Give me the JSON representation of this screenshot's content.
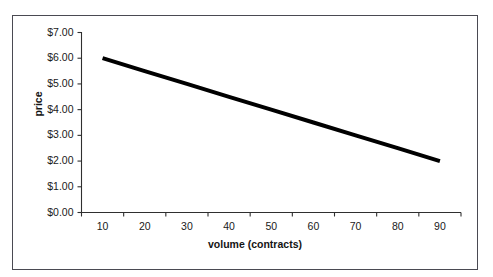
{
  "figure": {
    "background_color": "#ffffff",
    "frame_border_color": "#4a4a52",
    "series_color": "#000000",
    "axis_color": "#2f2f2f",
    "text_color": "#1a1a1a"
  },
  "cropped_caption": "",
  "chart_data": {
    "type": "line",
    "title": "",
    "xlabel": "volume (contracts)",
    "ylabel": "price",
    "categories": [
      10,
      20,
      30,
      40,
      50,
      60,
      70,
      80,
      90
    ],
    "x_tick_labels": [
      "10",
      "20",
      "30",
      "40",
      "50",
      "60",
      "70",
      "80",
      "90"
    ],
    "y_tick_labels": [
      "$0.00",
      "$1.00",
      "$2.00",
      "$3.00",
      "$4.00",
      "$5.00",
      "$6.00",
      "$7.00"
    ],
    "y_tick_values": [
      0,
      1,
      2,
      3,
      4,
      5,
      6,
      7
    ],
    "ylim": [
      0,
      7
    ],
    "grid": false,
    "legend": false,
    "legend_position": "none",
    "series": [
      {
        "name": "price",
        "values": [
          6.0,
          5.5,
          5.0,
          4.5,
          4.0,
          3.5,
          3.0,
          2.5,
          2.0
        ]
      }
    ]
  }
}
